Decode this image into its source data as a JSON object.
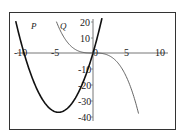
{
  "chart_data": {
    "type": "line",
    "title": "",
    "xlabel": "",
    "ylabel": "",
    "xlim": [
      -11,
      12
    ],
    "ylim": [
      -42,
      22
    ],
    "grid": false,
    "x_ticks": [
      "-10",
      "-5",
      "0",
      "5",
      "10"
    ],
    "y_ticks": [
      "20",
      "10",
      "-10",
      "-20",
      "-30",
      "-40"
    ],
    "series": [
      {
        "name": "P",
        "color": "#111111",
        "description": "upward parabola, approx y = 1.5x(x+10), roots at x=-10 and x=0, minimum near (-5, -37.5)",
        "x": [
          -11.2,
          -10,
          -9,
          -8,
          -7,
          -6,
          -5,
          -4,
          -3,
          -2,
          -1,
          0,
          1,
          1.3
        ],
        "y": [
          20,
          0,
          -13.5,
          -24,
          -31.5,
          -36,
          -37.5,
          -36,
          -31.5,
          -24,
          -13.5,
          0,
          16.5,
          22
        ]
      },
      {
        "name": "Q",
        "color": "#555555",
        "description": "decreasing cubic, approx y = -x^3/7.5, flat at origin",
        "x": [
          -5.3,
          -4,
          -3,
          -2,
          -1,
          0,
          1,
          2,
          3,
          4,
          5,
          6,
          6.6
        ],
        "y": [
          19.8,
          8.5,
          3.6,
          1.1,
          0.1,
          0,
          -0.1,
          -1.1,
          -3.6,
          -8.5,
          -16.7,
          -28.8,
          -38.3
        ]
      }
    ],
    "annotations": [
      "P",
      "Q"
    ]
  },
  "labels": {
    "x_ticks": [
      "-10",
      "-5",
      "0",
      "5",
      "10"
    ],
    "y_ticks": [
      "20",
      "10",
      "-10",
      "-20",
      "-30",
      "-40"
    ],
    "curve_p": "P",
    "curve_q": "Q"
  }
}
